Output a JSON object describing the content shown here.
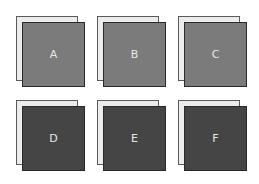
{
  "colors": {
    "light_front": "#7b7b7b",
    "dark_front": "#454545",
    "back_sheet": "#ececec"
  },
  "tiles": [
    {
      "label": "A",
      "shade": "light"
    },
    {
      "label": "B",
      "shade": "light"
    },
    {
      "label": "C",
      "shade": "light"
    },
    {
      "label": "D",
      "shade": "dark"
    },
    {
      "label": "E",
      "shade": "dark"
    },
    {
      "label": "F",
      "shade": "dark"
    }
  ]
}
